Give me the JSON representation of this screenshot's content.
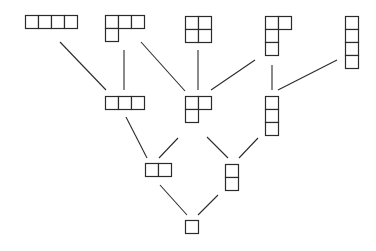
{
  "diagram": {
    "type": "hasse-diagram-young-lattice",
    "background": "#ffffff",
    "line_color": "#2b2b2b",
    "cell_size": 13,
    "nodes": [
      {
        "id": "p4",
        "partition": [
          4
        ],
        "rank": 4,
        "x": 25,
        "y": 15
      },
      {
        "id": "p31",
        "partition": [
          3,
          1
        ],
        "rank": 4,
        "x": 105,
        "y": 15
      },
      {
        "id": "p22",
        "partition": [
          2,
          2
        ],
        "rank": 4,
        "x": 185,
        "y": 16
      },
      {
        "id": "p211",
        "partition": [
          2,
          1,
          1
        ],
        "rank": 4,
        "x": 265,
        "y": 16
      },
      {
        "id": "p1111",
        "partition": [
          1,
          1,
          1,
          1
        ],
        "rank": 4,
        "x": 345,
        "y": 16
      },
      {
        "id": "p3",
        "partition": [
          3
        ],
        "rank": 3,
        "x": 105,
        "y": 96
      },
      {
        "id": "p21",
        "partition": [
          2,
          1
        ],
        "rank": 3,
        "x": 185,
        "y": 96
      },
      {
        "id": "p111",
        "partition": [
          1,
          1,
          1
        ],
        "rank": 3,
        "x": 265,
        "y": 96
      },
      {
        "id": "p2",
        "partition": [
          2
        ],
        "rank": 2,
        "x": 145,
        "y": 163
      },
      {
        "id": "p11",
        "partition": [
          1,
          1
        ],
        "rank": 2,
        "x": 225,
        "y": 164
      },
      {
        "id": "p1",
        "partition": [
          1
        ],
        "rank": 1,
        "x": 185,
        "y": 220
      }
    ],
    "edges": [
      {
        "from": "p4",
        "to": "p3",
        "x1": 60,
        "y1": 42,
        "x2": 106,
        "y2": 90
      },
      {
        "from": "p31",
        "to": "p3",
        "x1": 124,
        "y1": 50,
        "x2": 124,
        "y2": 90
      },
      {
        "from": "p31",
        "to": "p21",
        "x1": 141,
        "y1": 42,
        "x2": 185,
        "y2": 91
      },
      {
        "from": "p22",
        "to": "p21",
        "x1": 198,
        "y1": 50,
        "x2": 198,
        "y2": 90
      },
      {
        "from": "p211",
        "to": "p21",
        "x1": 255,
        "y1": 60,
        "x2": 211,
        "y2": 90
      },
      {
        "from": "p211",
        "to": "p111",
        "x1": 272,
        "y1": 65,
        "x2": 272,
        "y2": 90
      },
      {
        "from": "p1111",
        "to": "p111",
        "x1": 337,
        "y1": 60,
        "x2": 278,
        "y2": 90
      },
      {
        "from": "p3",
        "to": "p2",
        "x1": 126,
        "y1": 117,
        "x2": 147,
        "y2": 158
      },
      {
        "from": "p21",
        "to": "p2",
        "x1": 178,
        "y1": 138,
        "x2": 159,
        "y2": 158
      },
      {
        "from": "p21",
        "to": "p11",
        "x1": 207,
        "y1": 137,
        "x2": 228,
        "y2": 158
      },
      {
        "from": "p111",
        "to": "p11",
        "x1": 258,
        "y1": 138,
        "x2": 239,
        "y2": 158
      },
      {
        "from": "p2",
        "to": "p1",
        "x1": 160,
        "y1": 185,
        "x2": 187,
        "y2": 215
      },
      {
        "from": "p11",
        "to": "p1",
        "x1": 218,
        "y1": 195,
        "x2": 198,
        "y2": 215
      }
    ]
  }
}
